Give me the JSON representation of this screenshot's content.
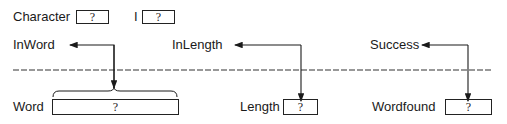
{
  "top_row": {
    "character": {
      "label": "Character",
      "value": "?"
    },
    "i": {
      "label": "I",
      "value": "?"
    }
  },
  "parameters": {
    "inword": {
      "label": "InWord"
    },
    "inlength": {
      "label": "InLength"
    },
    "success": {
      "label": "Success"
    }
  },
  "bottom_row": {
    "word": {
      "label": "Word",
      "value": "?"
    },
    "length": {
      "label": "Length",
      "value": "?"
    },
    "wordfound": {
      "label": "Wordfound",
      "value": "?"
    }
  },
  "colors": {
    "ink": "#1a1a1a",
    "background": "#ffffff"
  }
}
